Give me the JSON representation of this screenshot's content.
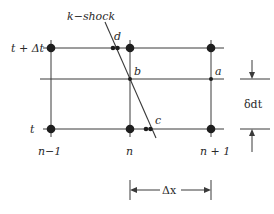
{
  "diagram": {
    "shock_label": "k−shock",
    "time_labels": {
      "top": "t + Δt",
      "bottom": "t"
    },
    "column_labels": [
      "n−1",
      "n",
      "n + 1"
    ],
    "point_labels": {
      "a": "a",
      "b": "b",
      "c": "c",
      "d": "d"
    },
    "dimensions": {
      "vertical": "δdt",
      "horizontal": "Δx"
    },
    "colors": {
      "line": "#3a3a3a",
      "node": "#1e1e1e",
      "background": "#ffffff"
    }
  }
}
